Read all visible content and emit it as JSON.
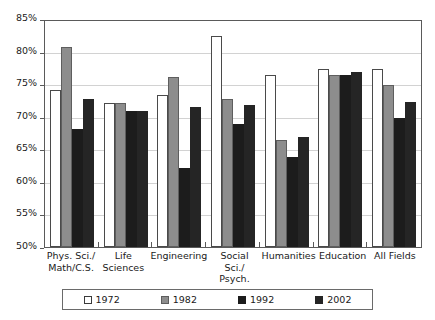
{
  "chart_data": {
    "type": "bar",
    "title": "",
    "subtitle": "",
    "xlabel": "",
    "ylabel": "",
    "ylim": [
      50,
      85
    ],
    "ytick_step": 5,
    "ytick_labels": [
      "85%",
      "80%",
      "75%",
      "70%",
      "65%",
      "60%",
      "55%",
      "50%"
    ],
    "ytick_values": [
      85,
      80,
      75,
      70,
      65,
      60,
      55,
      50
    ],
    "grid": true,
    "grid_axis": "y",
    "legend_position": "bottom",
    "categories": [
      "Phys. Sci./ Math/C.S.",
      "Life Sciences",
      "Engineering",
      "Social Sci./ Psych.",
      "Humanities",
      "Education",
      "All Fields"
    ],
    "category_lines": [
      [
        "Phys. Sci./",
        "Math/C.S."
      ],
      [
        "Life Sciences"
      ],
      [
        "Engineering"
      ],
      [
        "Social Sci./",
        "Psych."
      ],
      [
        "Humanities"
      ],
      [
        "Education"
      ],
      [
        "All Fields"
      ]
    ],
    "series": [
      {
        "name": "1972",
        "color": "#ffffff",
        "values": [
          74.3,
          72.3,
          73.5,
          82.7,
          76.7,
          77.6,
          77.6
        ]
      },
      {
        "name": "1982",
        "color": "#8d8d8d",
        "values": [
          81.0,
          72.3,
          76.3,
          73.0,
          66.6,
          76.6,
          75.1
        ]
      },
      {
        "name": "1992",
        "color": "#1c1c1c",
        "values": [
          68.3,
          71.0,
          62.3,
          69.0,
          63.9,
          76.6,
          70.0
        ]
      },
      {
        "name": "2002",
        "color": "#252525",
        "values": [
          73.0,
          71.0,
          71.7,
          72.0,
          67.0,
          77.1,
          72.5
        ]
      }
    ]
  },
  "legend": {
    "items": [
      {
        "label": "1972"
      },
      {
        "label": "1982"
      },
      {
        "label": "1992"
      },
      {
        "label": "2002"
      }
    ]
  }
}
